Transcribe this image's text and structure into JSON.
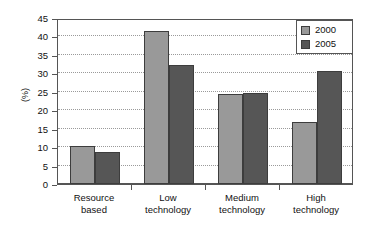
{
  "chart_data": {
    "type": "bar",
    "title": "",
    "subtitle": "",
    "xlabel": "",
    "ylabel": "(%)",
    "ylim": [
      0,
      45
    ],
    "ytick_step": 5,
    "yticks": [
      0,
      5,
      10,
      15,
      20,
      25,
      30,
      35,
      40,
      45
    ],
    "grid": true,
    "grid_axis": "y",
    "legend_position": "top-right",
    "categories": [
      "Resource based",
      "Low technology",
      "Medium technology",
      "High technology"
    ],
    "category_lines": [
      [
        "Resource",
        "based"
      ],
      [
        "Low",
        "technology"
      ],
      [
        "Medium",
        "technology"
      ],
      [
        "High",
        "technology"
      ]
    ],
    "series": [
      {
        "name": "2000",
        "color": "#999999",
        "values": [
          10.3,
          41.5,
          24.3,
          16.7
        ]
      },
      {
        "name": "2005",
        "color": "#565656",
        "values": [
          8.7,
          32.3,
          24.7,
          30.7
        ]
      }
    ]
  },
  "axis": {
    "y_title": "(%)"
  },
  "legend": {
    "entries": [
      {
        "label": "2000",
        "color": "#999999"
      },
      {
        "label": "2005",
        "color": "#565656"
      }
    ]
  },
  "colors": {
    "series_2000": "#999999",
    "series_2005": "#565656",
    "axis": "#555555",
    "grid": "#9a9a9a",
    "bar_outline": "#3d3d3d",
    "background": "#ffffff",
    "text": "#111111"
  }
}
